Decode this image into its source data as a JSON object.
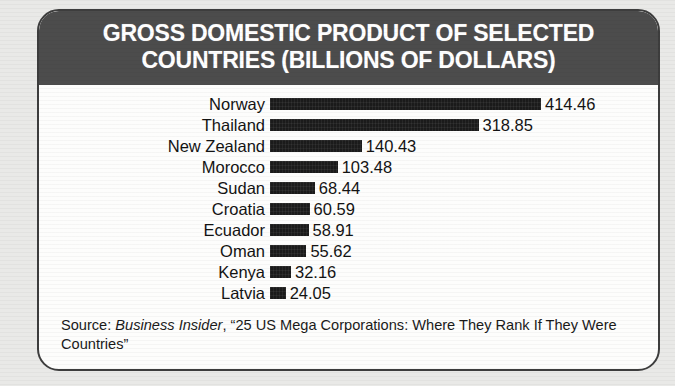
{
  "card": {
    "header_title": "GROSS DOMESTIC PRODUCT OF SELECTED\nCOUNTRIES (BILLIONS OF DOLLARS)"
  },
  "source": {
    "prefix": "Source: ",
    "publication": "Business Insider",
    "article": ", “25 US Mega Corporations: Where They Rank If They Were Countries”"
  },
  "colors": {
    "header_band": "#4c4c4c",
    "bar": "#1b1b1b",
    "card_border": "#3d3d3d",
    "page_background": "#e9e9e7",
    "card_background": "#fdfdfc",
    "text": "#131313"
  },
  "chart_data": {
    "type": "bar",
    "orientation": "horizontal",
    "title": "GROSS DOMESTIC PRODUCT OF SELECTED COUNTRIES (BILLIONS OF DOLLARS)",
    "xlabel": "",
    "ylabel": "",
    "unit": "billions of dollars",
    "grid": false,
    "legend": false,
    "axis_visible": false,
    "value_labels": true,
    "xlim": [
      0,
      414.46
    ],
    "categories": [
      "Norway",
      "Thailand",
      "New Zealand",
      "Morocco",
      "Sudan",
      "Croatia",
      "Ecuador",
      "Oman",
      "Kenya",
      "Latvia"
    ],
    "values": [
      414.46,
      318.85,
      140.43,
      103.48,
      68.44,
      60.59,
      58.91,
      55.62,
      32.16,
      24.05
    ],
    "value_labels_text": [
      "414.46",
      "318.85",
      "140.43",
      "103.48",
      "68.44",
      "60.59",
      "58.91",
      "55.62",
      "32.16",
      "24.05"
    ],
    "source": "Business Insider, “25 US Mega Corporations: Where They Rank If They Were Countries”"
  }
}
